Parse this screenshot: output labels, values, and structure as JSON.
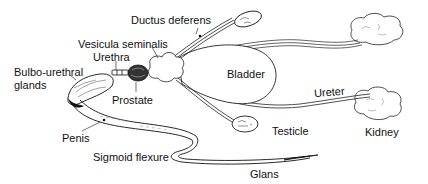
{
  "diagram": {
    "background_color": "#ffffff",
    "line_color": "#111111",
    "labels": {
      "ductus_deferens": "Ductus deferens",
      "vesicula_seminalis": "Vesicula seminalis",
      "urethra": "Urethra",
      "bulbo_urethral_glands_line1": "Bulbo-urethral",
      "bulbo_urethral_glands_line2": "glands",
      "prostate": "Prostate",
      "bladder": "Bladder",
      "ureter": "Ureter",
      "testicle": "Testicle",
      "kidney": "Kidney",
      "penis": "Penis",
      "sigmoid_flexure": "Sigmoid flexure",
      "glans": "Glans"
    },
    "structures": [
      "ductus-deferens",
      "vesicula-seminalis",
      "urethra",
      "bulbo-urethral-glands",
      "prostate",
      "bladder",
      "ureter-upper",
      "ureter-lower",
      "testicle-upper",
      "testicle-lower",
      "kidney-upper",
      "kidney-lower",
      "penis",
      "sigmoid-flexure",
      "glans"
    ]
  }
}
